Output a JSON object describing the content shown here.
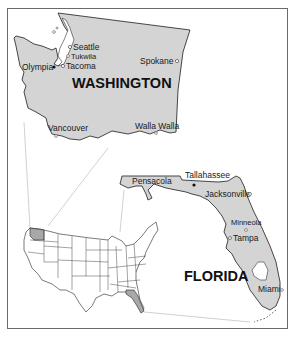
{
  "colors": {
    "state_fill": "#d4d4d4",
    "outline": "#333333",
    "highlight_fill": "#a8a8a8",
    "connector": "#bdbdbd",
    "frame": "#6a6a6a",
    "background": "#ffffff"
  },
  "washington": {
    "label": "WASHINGTON",
    "cities": [
      {
        "name": "Seattle",
        "marker": "open-circle"
      },
      {
        "name": "Tukwila",
        "marker": "open-circle"
      },
      {
        "name": "Tacoma",
        "marker": "open-circle"
      },
      {
        "name": "Olympia",
        "marker": "filled-dot (capital)"
      },
      {
        "name": "Spokane",
        "marker": "open-circle"
      },
      {
        "name": "Vancouver",
        "marker": "open-circle"
      },
      {
        "name": "Walla Walla",
        "marker": "open-circle"
      }
    ]
  },
  "florida": {
    "label": "FLORIDA",
    "cities": [
      {
        "name": "Pensacola",
        "marker": "none"
      },
      {
        "name": "Tallahassee",
        "marker": "filled-dot (capital)"
      },
      {
        "name": "Jacksonville",
        "marker": "open-circle"
      },
      {
        "name": "Minneola",
        "marker": "open-circle"
      },
      {
        "name": "Tampa",
        "marker": "open-circle"
      },
      {
        "name": "Miami",
        "marker": "open-circle"
      }
    ]
  },
  "usa_inset": {
    "highlighted_states": [
      "Washington",
      "Florida"
    ]
  }
}
